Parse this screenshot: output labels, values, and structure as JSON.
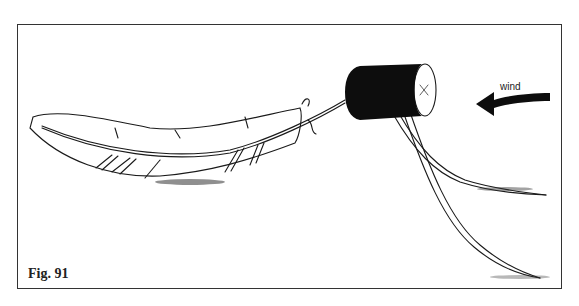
{
  "figure": {
    "caption": "Fig. 91",
    "wind_label": "wind",
    "colors": {
      "line": "#1a1a1a",
      "fill": "#0d0d0d",
      "background": "#ffffff",
      "frame": "#333333"
    }
  }
}
